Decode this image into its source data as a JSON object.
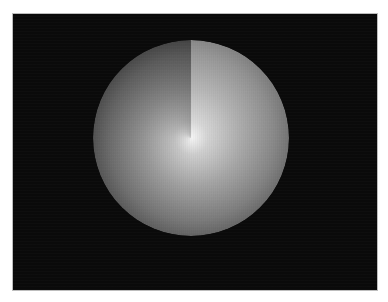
{
  "figure": {
    "background_color": "#0a0a0a",
    "page_color": "#ffffff",
    "center": [
      191,
      138
    ],
    "radius": 98,
    "seam_angle": "12 o'clock",
    "highlight_color": "#f4f4f4"
  }
}
